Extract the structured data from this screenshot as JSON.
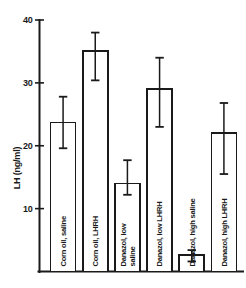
{
  "chart_data": {
    "type": "bar",
    "title": "",
    "xlabel": "",
    "ylabel": "LH (ng/ml)",
    "ylim": [
      0,
      40
    ],
    "yticks": [
      10,
      20,
      30,
      40
    ],
    "ytick_labels": [
      "10",
      "20",
      "30",
      "40"
    ],
    "grid": false,
    "legend": "none",
    "categories": [
      "Corn oil, saline",
      "Corn oil, LHRH",
      "Danazol, low saline",
      "Danazol, low LHRH",
      "Danazol, high saline",
      "Danazol, high LHRH"
    ],
    "values": [
      23.7,
      35.1,
      14.0,
      29.0,
      2.6,
      22.0
    ],
    "errors_upper": [
      27.8,
      38.0,
      17.7,
      34.0,
      3.4,
      26.8
    ],
    "errors_lower": [
      19.6,
      30.4,
      12.2,
      23.0,
      1.6,
      15.5
    ],
    "bars": [
      {
        "label": "Corn oil, saline",
        "label_lines": [
          "Corn oil, saline"
        ],
        "value": 23.7,
        "error_upper": 27.8,
        "error_lower": 19.6
      },
      {
        "label": "Corn oil, LHRH",
        "label_lines": [
          "Corn oil, LHRH"
        ],
        "value": 35.1,
        "error_upper": 38.0,
        "error_lower": 30.4
      },
      {
        "label": "Danazol, low saline",
        "label_lines": [
          "Danazol, low",
          "saline"
        ],
        "value": 14.0,
        "error_upper": 17.7,
        "error_lower": 12.2
      },
      {
        "label": "Danazol, low LHRH",
        "label_lines": [
          "Danazol, low LHRH"
        ],
        "value": 29.0,
        "error_upper": 34.0,
        "error_lower": 23.0
      },
      {
        "label": "Danazol, high saline",
        "label_lines": [
          "Danazol, high saline"
        ],
        "value": 2.6,
        "error_upper": 3.4,
        "error_lower": 1.6
      },
      {
        "label": "Danazol, high LHRH",
        "label_lines": [
          "Danazol, high LHRH"
        ],
        "value": 22.0,
        "error_upper": 26.8,
        "error_lower": 15.5
      }
    ],
    "colors": {
      "ink": "#1a1a1a",
      "bar_fill": "#ffffff",
      "background": "#ffffff"
    }
  }
}
